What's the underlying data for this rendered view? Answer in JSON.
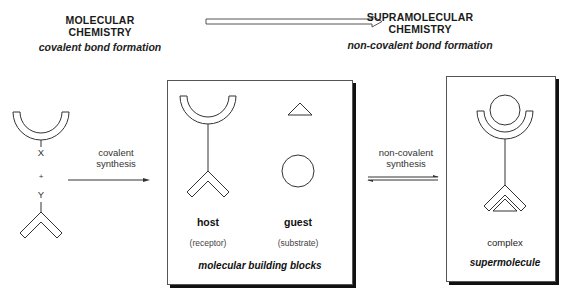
{
  "left_header": {
    "title_line1": "MOLECULAR",
    "title_line2": "CHEMISTRY",
    "subtitle": "covalent bond formation"
  },
  "right_header": {
    "title_line1": "SUPRAMOLECULAR",
    "title_line2": "CHEMISTRY",
    "subtitle": "non-covalent bond formation"
  },
  "reactants": {
    "top_label": "X",
    "plus": "+",
    "bottom_label": "Y"
  },
  "arrow_covalent": {
    "line1": "covalent",
    "line2": "synthesis"
  },
  "building_blocks_box": {
    "host_label": "host",
    "host_sublabel": "(receptor)",
    "guest_label": "guest",
    "guest_sublabel": "(substrate)",
    "caption": "molecular building blocks"
  },
  "arrow_noncovalent": {
    "line1": "non-covalent",
    "line2": "synthesis"
  },
  "supermolecule_box": {
    "label": "complex",
    "caption": "supermolecule"
  },
  "colors": {
    "line": "#333333",
    "shadow": "#111111",
    "background": "#ffffff"
  }
}
